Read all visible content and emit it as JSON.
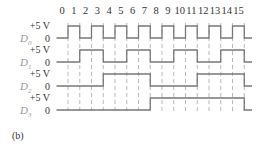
{
  "figure": {
    "caption": "(b)",
    "column_numbers": [
      "0",
      "1",
      "2",
      "3",
      "4",
      "5",
      "6",
      "7",
      "8",
      "9",
      "10",
      "11",
      "12",
      "13",
      "14",
      "15"
    ],
    "signals": [
      {
        "name": "D",
        "sub": "0",
        "high_label": "+5 V",
        "low_label": "0",
        "bits": [
          0,
          1,
          0,
          1,
          0,
          1,
          0,
          1,
          0,
          1,
          0,
          1,
          0,
          1,
          0,
          1
        ]
      },
      {
        "name": "D",
        "sub": "1",
        "high_label": "+5 V",
        "low_label": "0",
        "bits": [
          0,
          0,
          1,
          1,
          0,
          0,
          1,
          1,
          0,
          0,
          1,
          1,
          0,
          0,
          1,
          1
        ]
      },
      {
        "name": "D",
        "sub": "2",
        "high_label": "+5 V",
        "low_label": "0",
        "bits": [
          0,
          0,
          0,
          0,
          1,
          1,
          1,
          1,
          0,
          0,
          0,
          0,
          1,
          1,
          1,
          1
        ]
      },
      {
        "name": "D",
        "sub": "3",
        "high_label": "+5 V",
        "low_label": "0",
        "bits": [
          0,
          0,
          0,
          0,
          0,
          0,
          0,
          0,
          1,
          1,
          1,
          1,
          1,
          1,
          1,
          1
        ]
      }
    ]
  }
}
